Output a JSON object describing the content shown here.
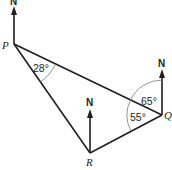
{
  "diagram": {
    "points": {
      "P": {
        "label": "P",
        "x": 14,
        "y": 44
      },
      "Q": {
        "label": "Q",
        "x": 162,
        "y": 115
      },
      "R": {
        "label": "R",
        "x": 90,
        "y": 153
      }
    },
    "north_label": "N",
    "angles": {
      "P_QPR": "28°",
      "Q_north_to_P": "65°",
      "Q_PQR": "55°"
    },
    "colors": {
      "line": "#231f20",
      "arc": "#777777",
      "background": "#ffffff"
    }
  }
}
